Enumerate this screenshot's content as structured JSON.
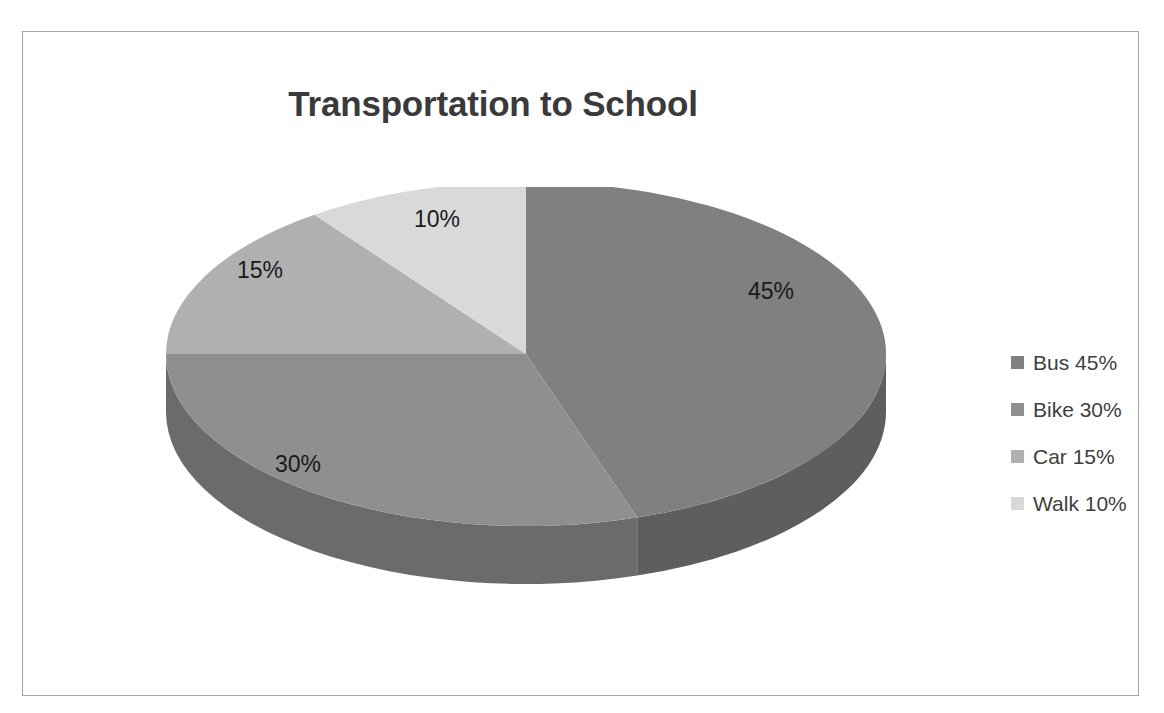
{
  "chart_data": {
    "type": "pie",
    "title": "Transportation to School",
    "xlabel": "",
    "ylabel": "",
    "categories": [
      "Bus",
      "Bike",
      "Car",
      "Walk"
    ],
    "values": [
      45,
      30,
      15,
      10
    ],
    "value_unit": "%",
    "data_labels": [
      "45%",
      "30%",
      "15%",
      "10%"
    ],
    "colors": [
      "#808080",
      "#8f8f8f",
      "#b0b0b0",
      "#d9d9d9"
    ],
    "side_colors": [
      "#5e5e5e",
      "#6b6b6b",
      "#858585",
      "#a8a8a8"
    ],
    "legend": {
      "position": "right",
      "entries": [
        {
          "label": "Bus 45%",
          "color": "#808080"
        },
        {
          "label": "Bike 30%",
          "color": "#8f8f8f"
        },
        {
          "label": "Car 15%",
          "color": "#b0b0b0"
        },
        {
          "label": "Walk 10%",
          "color": "#d9d9d9"
        }
      ]
    },
    "grid": false,
    "three_d": true,
    "start_angle_deg": 0,
    "direction": "clockwise"
  },
  "labels": {
    "bus": "45%",
    "bike": "30%",
    "car": "15%",
    "walk": "10%"
  },
  "legend_items": {
    "bus": "Bus 45%",
    "bike": "Bike 30%",
    "car": "Car 15%",
    "walk": "Walk 10%"
  },
  "frame": {
    "border_color": "#a6a6a6"
  }
}
